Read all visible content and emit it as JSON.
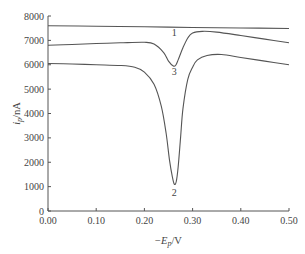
{
  "chart_data": {
    "type": "line",
    "title": "",
    "xlabel": "−E_p/V",
    "ylabel": "i_p/nA",
    "xlim": [
      0.0,
      0.5
    ],
    "ylim": [
      0,
      8000
    ],
    "grid": false,
    "legend_position": "inline curve labels",
    "x_ticks": [
      "0.00",
      "0.10",
      "0.20",
      "0.30",
      "0.40",
      "0.50"
    ],
    "y_ticks": [
      "0",
      "1000",
      "2000",
      "3000",
      "4000",
      "5000",
      "6000",
      "7000",
      "8000"
    ],
    "series": [
      {
        "name": "1",
        "label_pos": [
          0.262,
          7180
        ],
        "points": [
          [
            0.0,
            7600
          ],
          [
            0.1,
            7580
          ],
          [
            0.2,
            7560
          ],
          [
            0.3,
            7530
          ],
          [
            0.4,
            7510
          ],
          [
            0.5,
            7490
          ]
        ]
      },
      {
        "name": "3",
        "label_pos": [
          0.262,
          5600
        ],
        "points": [
          [
            0.0,
            6800
          ],
          [
            0.05,
            6830
          ],
          [
            0.1,
            6870
          ],
          [
            0.15,
            6900
          ],
          [
            0.2,
            6920
          ],
          [
            0.22,
            6850
          ],
          [
            0.24,
            6500
          ],
          [
            0.25,
            6150
          ],
          [
            0.26,
            5950
          ],
          [
            0.265,
            5980
          ],
          [
            0.27,
            6200
          ],
          [
            0.28,
            6700
          ],
          [
            0.29,
            7100
          ],
          [
            0.3,
            7300
          ],
          [
            0.32,
            7370
          ],
          [
            0.35,
            7340
          ],
          [
            0.4,
            7200
          ],
          [
            0.45,
            7050
          ],
          [
            0.5,
            6900
          ]
        ]
      },
      {
        "name": "2",
        "label_pos": [
          0.262,
          600
        ],
        "points": [
          [
            0.0,
            6050
          ],
          [
            0.05,
            6030
          ],
          [
            0.1,
            6000
          ],
          [
            0.15,
            5970
          ],
          [
            0.18,
            5900
          ],
          [
            0.2,
            5700
          ],
          [
            0.22,
            5200
          ],
          [
            0.235,
            4300
          ],
          [
            0.245,
            3200
          ],
          [
            0.252,
            2100
          ],
          [
            0.258,
            1400
          ],
          [
            0.262,
            1100
          ],
          [
            0.266,
            1200
          ],
          [
            0.27,
            1800
          ],
          [
            0.275,
            3000
          ],
          [
            0.28,
            4200
          ],
          [
            0.29,
            5400
          ],
          [
            0.3,
            5900
          ],
          [
            0.31,
            6200
          ],
          [
            0.33,
            6380
          ],
          [
            0.36,
            6420
          ],
          [
            0.4,
            6300
          ],
          [
            0.45,
            6150
          ],
          [
            0.5,
            6000
          ]
        ]
      }
    ]
  }
}
